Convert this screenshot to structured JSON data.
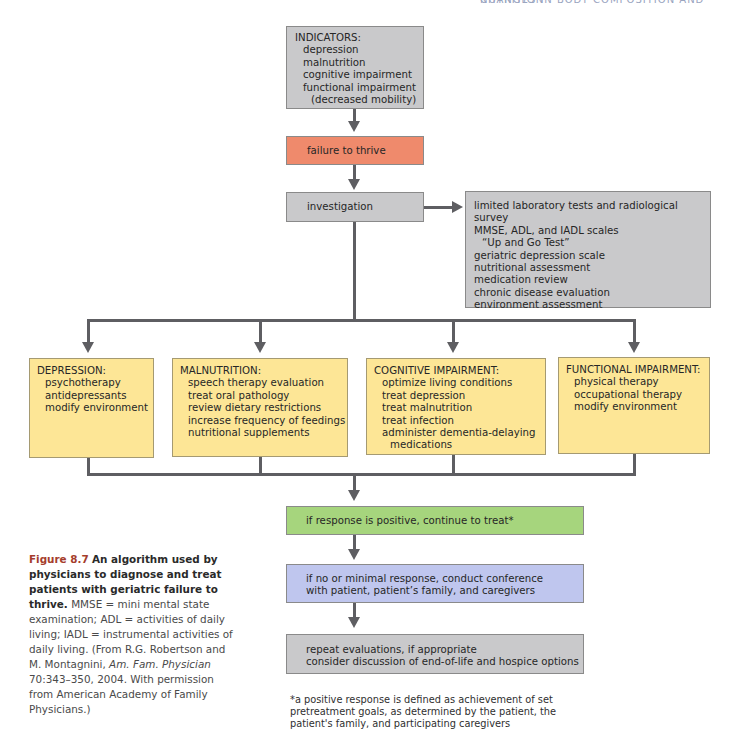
{
  "header": {
    "running_head": "CHANGES IN BODY COMPOSITION AND NUTRITION"
  },
  "indicators": {
    "title": "INDICATORS:",
    "items": [
      "depression",
      "malnutrition",
      "cognitive impairment",
      "functional impairment"
    ],
    "sub_item": "(decreased mobility)"
  },
  "failure": {
    "label": "failure to thrive"
  },
  "investigation": {
    "label": "investigation",
    "details": [
      "limited laboratory tests and radiological survey",
      "MMSE, ADL, and IADL scales",
      "“Up and Go Test”",
      "geriatric depression scale",
      "nutritional assessment",
      "medication review",
      "chronic disease evaluation",
      "environment assessment"
    ]
  },
  "treatments": [
    {
      "title": "DEPRESSION:",
      "items": [
        "psychotherapy",
        "antidepressants",
        "modify environment"
      ]
    },
    {
      "title": "MALNUTRITION:",
      "items": [
        "speech therapy evaluation",
        "treat oral pathology",
        "review dietary restrictions",
        "increase frequency of feedings",
        "nutritional supplements"
      ]
    },
    {
      "title": "COGNITIVE IMPAIRMENT:",
      "items": [
        "optimize living conditions",
        "treat depression",
        "treat malnutrition",
        "treat infection",
        "administer dementia-delaying"
      ],
      "continuation": "medications"
    },
    {
      "title": "FUNCTIONAL IMPAIRMENT:",
      "items": [
        "physical therapy",
        "occupational therapy",
        "modify environment"
      ]
    }
  ],
  "positive": {
    "label": "if response is positive, continue to treat*"
  },
  "minimal": {
    "lines": [
      "if no or minimal response, conduct conference",
      "with patient, patient’s family, and caregivers"
    ]
  },
  "repeat": {
    "lines": [
      "repeat evaluations, if appropriate",
      "consider discussion of end-of-life and hospice options"
    ]
  },
  "footnote": {
    "lines": [
      "*a positive response is defined as achievement of set",
      "pretreatment goals, as determined by the patient, the",
      "patient's family, and participating caregivers"
    ]
  },
  "caption": {
    "fig_num": "Figure 8.7",
    "fig_title": "An algorithm used by physicians to diagnose and treat patients with geriatric failure to thrive.",
    "body_pre": "MMSE = mini mental state examination; ADL = activities of daily living; IADL = instrumental activities of daily living. (From R.G. Robertson and M. Montagnini,",
    "journal": "Am. Fam. Physician",
    "body_post": "70:343–350, 2004. With permission from American Academy of Family Physicians.)"
  },
  "colors": {
    "gray_box": "#c9c9cb",
    "failure_box": "#ef8a6c",
    "treatment_box": "#fde696",
    "positive_box": "#a6d57d",
    "minimal_box": "#bfc6ee",
    "connector": "#5e5e62",
    "figure_number": "#a53d2c"
  }
}
